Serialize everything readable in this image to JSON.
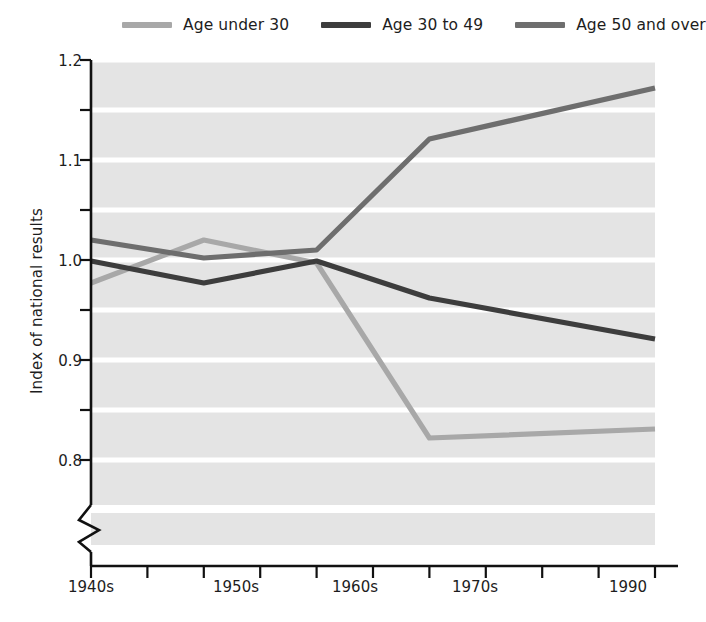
{
  "legend": {
    "position": "top",
    "items": [
      {
        "label": "Age under 30",
        "color": "#a8a8a8",
        "swatch_name": "legend-swatch-age-under-30"
      },
      {
        "label": "Age 30 to 49",
        "color": "#3d3d3d",
        "swatch_name": "legend-swatch-age-30-to-49"
      },
      {
        "label": "Age 50 and over",
        "color": "#6e6e6e",
        "swatch_name": "legend-swatch-age-50-and-over"
      }
    ]
  },
  "axes": {
    "ylabel": "Index of national results",
    "ytick_labels": [
      "1.2",
      "1.1",
      "1.0",
      "0.9",
      "0.8"
    ],
    "xtick_labels": [
      "1940s",
      "1950s",
      "1960s",
      "1970s",
      "1990"
    ],
    "axis_break": "zigzag-break"
  },
  "chart_data": {
    "type": "line",
    "title": "",
    "xlabel": "",
    "ylabel": "Index of national results",
    "categories": [
      "1940s",
      "1950s",
      "1960s",
      "1970s",
      "1990"
    ],
    "x": [
      1940,
      1950,
      1960,
      1970,
      1990
    ],
    "ylim": [
      0.8,
      1.2
    ],
    "yticks": [
      0.8,
      0.9,
      1.0,
      1.1,
      1.2
    ],
    "yminor_ticks": [
      0.85,
      0.95,
      1.05,
      1.15
    ],
    "grid": true,
    "grid_color": "#ffffff",
    "plot_background": "#e4e4e4",
    "axis_break_below": 0.8,
    "legend_position": "top",
    "series": [
      {
        "name": "Age under 30",
        "color": "#a8a8a8",
        "values": [
          0.977,
          1.02,
          0.997,
          0.822,
          0.831
        ]
      },
      {
        "name": "Age 30 to 49",
        "color": "#3d3d3d",
        "values": [
          0.999,
          0.977,
          0.999,
          0.962,
          0.921
        ]
      },
      {
        "name": "Age 50 and over",
        "color": "#6e6e6e",
        "values": [
          1.02,
          1.002,
          1.01,
          1.121,
          1.172
        ]
      }
    ]
  }
}
